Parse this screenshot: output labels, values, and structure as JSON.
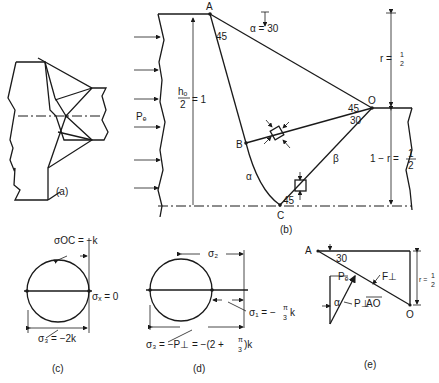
{
  "figure": {
    "panels": [
      {
        "id": "a",
        "caption": "(a)",
        "description": "Slip-line field overview of wedge-shaped die region"
      },
      {
        "id": "b",
        "caption": "(b)",
        "description": "Slip-line field detail"
      },
      {
        "id": "c",
        "caption": "(c)",
        "description": "Mohr circle at point O/C"
      },
      {
        "id": "d",
        "caption": "(d)",
        "description": "Mohr circle with hydrostatic shift"
      },
      {
        "id": "e",
        "caption": "(e)",
        "description": "Force equilibrium on region AO"
      }
    ]
  },
  "panel_a": {
    "caption": "(a)"
  },
  "panel_b": {
    "caption": "(b)",
    "points": {
      "A": "A",
      "B": "B",
      "C": "C",
      "O": "O"
    },
    "labels": {
      "pressure": "Pₑ",
      "height_num": "hₒ",
      "height_den": "2",
      "height_eq": "= 1",
      "alpha_angle": "α = 30",
      "angle_A": "45",
      "angle_O_upper": "45",
      "angle_O_lower": "30",
      "angle_C": "45",
      "alpha_line": "α",
      "beta_line": "β",
      "r_label": "r =",
      "r_num": "1",
      "r_den": "2",
      "one_minus_r": "1 − r =",
      "omr_num": "1",
      "omr_den": "2"
    }
  },
  "panel_c": {
    "caption": "(c)",
    "labels": {
      "sigma_oc": "σOC = −k",
      "sigma_x": "σₓ = 0",
      "sigma_3": "σ₃ = −2k"
    }
  },
  "panel_d": {
    "caption": "(d)",
    "labels": {
      "sigma_2": "σ₂",
      "sigma_1": "σ₁ = −",
      "sigma_1_num": "π",
      "sigma_1_den": "3",
      "sigma_1_k": "k",
      "sigma_3": "σ₃ = −P⊥ = −(2 +",
      "sigma_3_num": "π",
      "sigma_3_den": "3",
      "sigma_3_end": ")k"
    }
  },
  "panel_e": {
    "caption": "(e)",
    "labels": {
      "A": "A",
      "O": "O",
      "angle": "30",
      "F_perp": "F⊥",
      "P_e": "Pₑ",
      "alpha": "α",
      "P_perp_AO": "P⊥",
      "AO": "AO",
      "r_label": "r =",
      "r_num": "1",
      "r_den": "2"
    }
  }
}
